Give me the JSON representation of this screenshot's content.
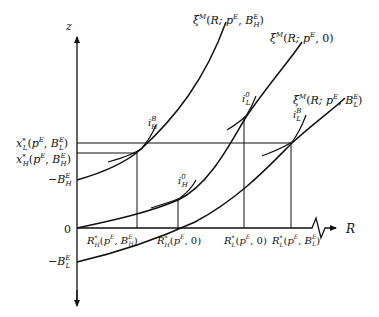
{
  "axes": {
    "y_label": "z",
    "x_label": "R",
    "origin_label": "0"
  },
  "y_ticks": {
    "xL_star": "x*_L(p^E, B_L^E)",
    "xH_star": "x*_H(p^E, B_H^E)",
    "neg_BH": "−B_H^E",
    "neg_BL": "−B_L^E"
  },
  "x_ticks": {
    "RH_BH": "R*_H(p^E, B_H^E)",
    "RH_0": "R*_H(p^E, 0)",
    "RL_0": "R*_L(p^E, 0)",
    "RL_BL": "R*_L(p^E, B_L^E)"
  },
  "curves": [
    {
      "name": "ξ^M(R; p^E, B_H^E)",
      "label_main": "ξ",
      "sup": "M",
      "args": "(R; p",
      "args_sup": "E",
      "args2": ", B",
      "args2_sup": "E",
      "args2_sub": "H",
      "close": ")"
    },
    {
      "name": "ξ^M(R; p^E, 0)",
      "label_main": "ξ",
      "sup": "M",
      "args": "(R; p",
      "args_sup": "E",
      "args2": ", 0)"
    },
    {
      "name": "ξ^M(R; p^E, B_L^E)",
      "label_main": "ξ",
      "sup": "M",
      "args": "(R; p",
      "args_sup": "E",
      "args2": ", B",
      "args2_sup": "E",
      "args2_sub": "L",
      "close": ")"
    }
  ],
  "indifference_labels": [
    {
      "id": "iHB",
      "base": "i",
      "sup": "B",
      "sub": "H"
    },
    {
      "id": "iH0",
      "base": "i",
      "sup": "0",
      "sub": "H"
    },
    {
      "id": "iL0",
      "base": "i",
      "sup": "0",
      "sub": "L"
    },
    {
      "id": "iLB",
      "base": "i",
      "sup": "B",
      "sub": "L"
    }
  ],
  "text": {
    "x": "x",
    "R": "R",
    "p": "p",
    "B": "B",
    "E": "E",
    "star": "*",
    "L": "L",
    "H": "H",
    "comma": ", ",
    "lparen": "(",
    "rparen": ")",
    "minus": "−",
    "zero_arg": ", 0)"
  }
}
